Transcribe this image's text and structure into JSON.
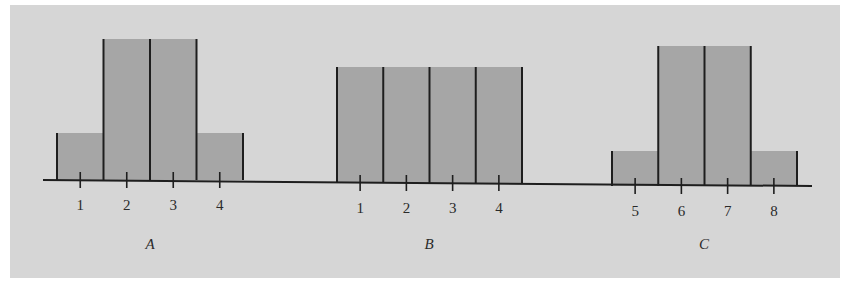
{
  "colors": {
    "background": "#d6d6d6",
    "bar_fill": "#a6a6a6",
    "line": "#1e1e1e",
    "text": "#2a2a2a"
  },
  "chart_data": [
    {
      "type": "bar",
      "title": "A",
      "categories": [
        "1",
        "2",
        "3",
        "4"
      ],
      "values": [
        0.125,
        0.375,
        0.375,
        0.125
      ],
      "relative_heights": [
        1,
        3,
        3,
        1
      ],
      "xlabel": "A",
      "ylabel": "",
      "grid": false,
      "legend": null,
      "layout": {
        "x_left": 57,
        "bar_width": 46.5,
        "baseline_y": 180,
        "px_per_unit": 376
      }
    },
    {
      "type": "bar",
      "title": "B",
      "categories": [
        "1",
        "2",
        "3",
        "4"
      ],
      "values": [
        0.25,
        0.25,
        0.25,
        0.25
      ],
      "relative_heights": [
        1,
        1,
        1,
        1
      ],
      "xlabel": "B",
      "ylabel": "",
      "grid": false,
      "legend": null,
      "layout": {
        "x_left": 337,
        "bar_width": 46.25,
        "baseline_y": 183,
        "px_per_unit": 464
      }
    },
    {
      "type": "bar",
      "title": "C",
      "categories": [
        "5",
        "6",
        "7",
        "8"
      ],
      "values": [
        0.1,
        0.4,
        0.4,
        0.1
      ],
      "relative_heights": [
        1,
        4,
        4,
        1
      ],
      "xlabel": "C",
      "ylabel": "",
      "grid": false,
      "legend": null,
      "layout": {
        "x_left": 612,
        "bar_width": 46.25,
        "baseline_y": 186,
        "px_per_unit": 350
      }
    }
  ],
  "axis": {
    "x_start": 43,
    "x_end": 812
  }
}
